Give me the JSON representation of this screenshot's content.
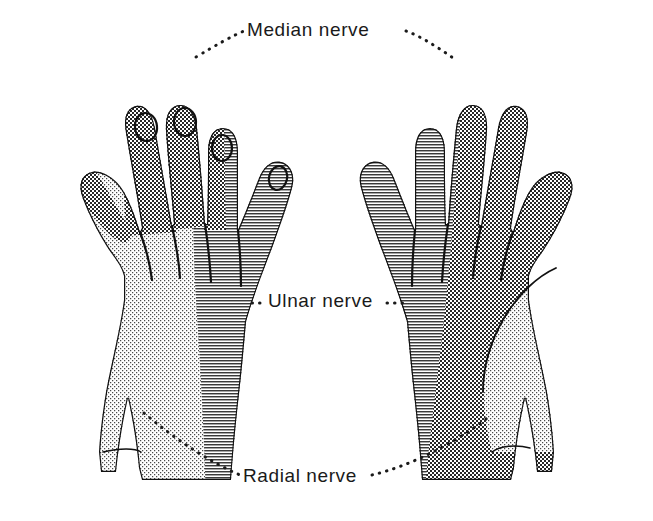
{
  "figure": {
    "view_left": "dorsum of hand",
    "view_right": "palm of hand",
    "background_color": "#ffffff",
    "ink_color": "#1a1a1a"
  },
  "labels": {
    "median": "Median nerve",
    "ulnar": "Ulnar nerve",
    "radial": "Radial nerve"
  },
  "legend": {
    "median_pattern": "dark cross-hatch",
    "ulnar_pattern": "horizontal lines",
    "radial_pattern": "light stipple",
    "median_color": "#2b2b2b",
    "ulnar_color": "#6e6e6e",
    "radial_color": "#b8b8b8"
  },
  "territories": [
    {
      "nerve": "Median nerve",
      "pattern": "dark cross-hatch",
      "hand": "left (dorsal view)",
      "regions": [
        "thumb tip",
        "index fingertip and distal phalanx",
        "middle fingertip and distal phalanx",
        "ring finger radial half of distal phalanx"
      ]
    },
    {
      "nerve": "Median nerve",
      "pattern": "dark cross-hatch",
      "hand": "right (palmar view)",
      "regions": [
        "thumb",
        "index finger",
        "middle finger",
        "ring finger radial half",
        "lateral palm"
      ]
    },
    {
      "nerve": "Ulnar nerve",
      "pattern": "horizontal lines",
      "hand": "left (dorsal view)",
      "regions": [
        "little finger",
        "ring finger ulnar half",
        "ulnar half of dorsum",
        "ulnar border of wrist"
      ]
    },
    {
      "nerve": "Ulnar nerve",
      "pattern": "horizontal lines",
      "hand": "right (palmar view)",
      "regions": [
        "little finger",
        "ring finger ulnar half",
        "hypothenar eminence",
        "medial palm"
      ]
    },
    {
      "nerve": "Radial nerve",
      "pattern": "light stipple",
      "hand": "left (dorsal view)",
      "regions": [
        "thumb dorsum proximal to tip",
        "radial half of dorsum of hand",
        "first web space",
        "proximal phalanges of index and middle fingers"
      ]
    },
    {
      "nerve": "Radial nerve",
      "pattern": "light stipple",
      "hand": "right (palmar view)",
      "regions": [
        "thenar eminence patch",
        "radial border of wrist"
      ]
    }
  ]
}
